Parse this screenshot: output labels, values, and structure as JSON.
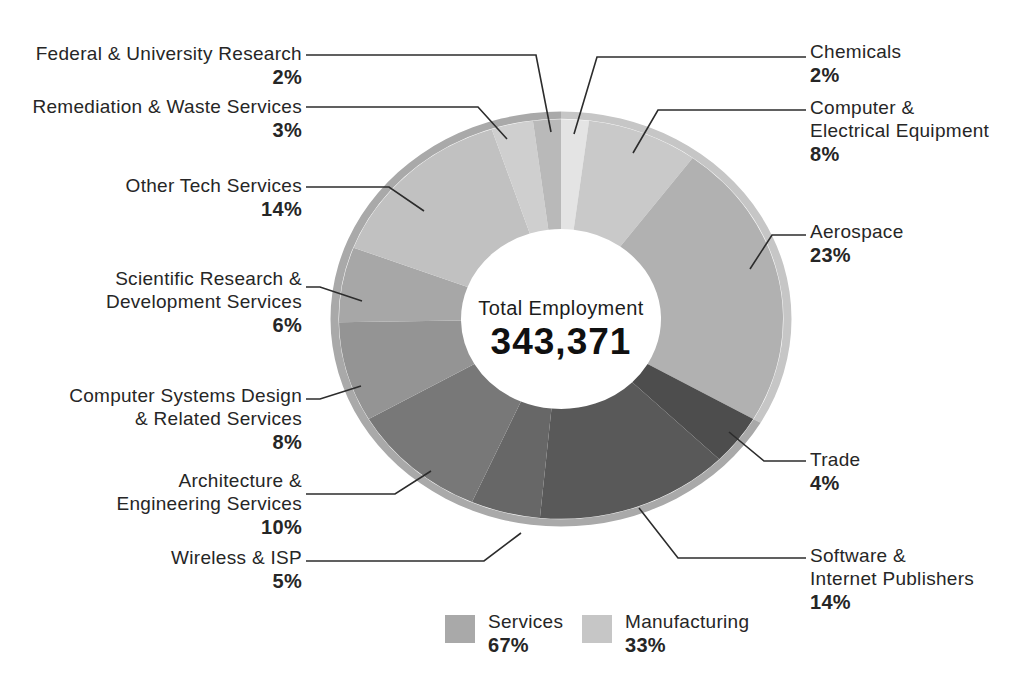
{
  "chart_data": {
    "type": "pie",
    "variant": "donut",
    "title": "",
    "center_label": "Total Employment",
    "center_value": "343,371",
    "start_angle": "top",
    "direction": "clockwise",
    "legend_position": "bottom",
    "text_color": "#262626",
    "leader_line_color": "#2c2c2c",
    "segments": [
      {
        "name": "Chemicals",
        "pct": 2,
        "pct_label": "2%",
        "color": "#e4e4e4",
        "group": "Manufacturing"
      },
      {
        "name": "Computer &\nElectrical Equipment",
        "pct": 8,
        "pct_label": "8%",
        "color": "#c9c9c9",
        "group": "Manufacturing"
      },
      {
        "name": "Aerospace",
        "pct": 23,
        "pct_label": "23%",
        "color": "#b1b1b1",
        "group": "Manufacturing"
      },
      {
        "name": "Trade",
        "pct": 4,
        "pct_label": "4%",
        "color": "#4d4d4d",
        "group": "Services"
      },
      {
        "name": "Software &\nInternet Publishers",
        "pct": 14,
        "pct_label": "14%",
        "color": "#595959",
        "group": "Services"
      },
      {
        "name": "Wireless & ISP",
        "pct": 5,
        "pct_label": "5%",
        "color": "#676767",
        "group": "Services"
      },
      {
        "name": "Architecture &\nEngineering Services",
        "pct": 10,
        "pct_label": "10%",
        "color": "#787878",
        "group": "Services"
      },
      {
        "name": "Computer Systems Design\n& Related Services",
        "pct": 8,
        "pct_label": "8%",
        "color": "#949494",
        "group": "Services"
      },
      {
        "name": "Scientific Research &\nDevelopment Services",
        "pct": 6,
        "pct_label": "6%",
        "color": "#a7a7a7",
        "group": "Services"
      },
      {
        "name": "Other Tech Services",
        "pct": 14,
        "pct_label": "14%",
        "color": "#c1c1c1",
        "group": "Services"
      },
      {
        "name": "Remediation & Waste Services",
        "pct": 3,
        "pct_label": "3%",
        "color": "#cfcfcf",
        "group": "Services"
      },
      {
        "name": "Federal & University Research",
        "pct": 2,
        "pct_label": "2%",
        "color": "#b9b9b9",
        "group": "Services"
      }
    ],
    "groups": [
      {
        "name": "Services",
        "pct": 67,
        "pct_label": "67%",
        "color": "#a9a9a9"
      },
      {
        "name": "Manufacturing",
        "pct": 33,
        "pct_label": "33%",
        "color": "#c6c6c6"
      }
    ]
  }
}
